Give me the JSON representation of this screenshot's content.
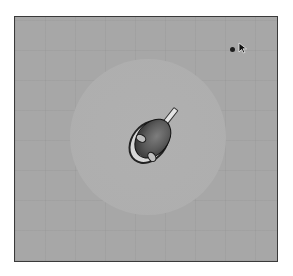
{
  "scene": {
    "type": "top-down shooter",
    "palette": {
      "background_outside": "#ffffff",
      "field": "#a7a7a7",
      "frame_border": "#3a3a3a",
      "ring_inner": "#b0b0b0",
      "ring_edge": "#9c9c9c",
      "player_body": "#5a5a5a",
      "player_hands": "#bdbdbd",
      "player_barrel": "#e4e4e4",
      "enemy_dot": "#1e1e1e"
    },
    "field": {
      "grid_spacing_px": 30
    },
    "ring": {
      "shape": "circle",
      "center": [
        147,
        136
      ],
      "radius": 78
    },
    "player": {
      "icon": "player-character-icon",
      "position": [
        150,
        140
      ],
      "facing": "up-right",
      "weapon": "gun-barrel-icon"
    },
    "enemy": {
      "icon": "enemy-dot-icon",
      "position": [
        231,
        48
      ]
    },
    "cursor": {
      "icon": "mouse-cursor-icon",
      "position": [
        238,
        40
      ]
    }
  }
}
